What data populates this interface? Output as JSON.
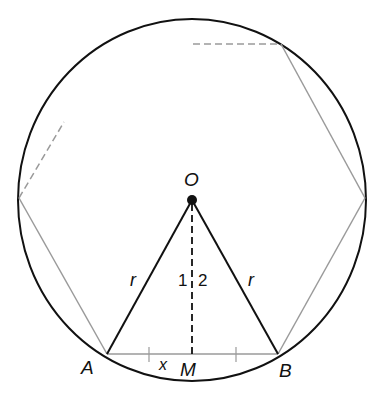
{
  "diagram": {
    "labels": {
      "center": "O",
      "point_a": "A",
      "point_b": "B",
      "midpoint": "M",
      "radius_left": "r",
      "radius_right": "r",
      "angle_1": "1",
      "angle_2": "2",
      "half_chord": "x"
    },
    "colors": {
      "circle": "#111111",
      "polygon": "#9a9a9a",
      "radius": "#111111"
    }
  }
}
